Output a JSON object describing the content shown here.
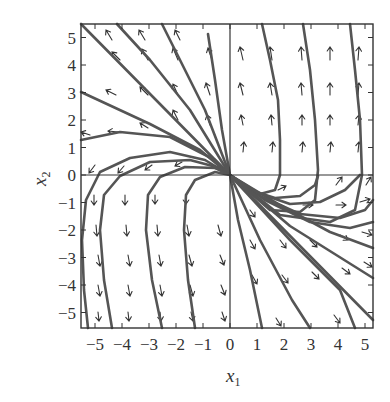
{
  "figure": {
    "type": "phase-portrait",
    "x_label": "x",
    "x_label_sub": "1",
    "y_label": "x",
    "y_label_sub": "2",
    "x_ticks": [
      "-5",
      "-4",
      "-3",
      "-2",
      "-1",
      "0",
      "1",
      "2",
      "3",
      "4",
      "5"
    ],
    "y_ticks": [
      "5",
      "4",
      "3",
      "2",
      "1",
      "0",
      "-1",
      "-2",
      "-3",
      "-4",
      "-5"
    ],
    "x_range": [
      -5.5,
      5.4
    ],
    "y_range": [
      -5.5,
      5.5
    ],
    "colors": {
      "trajectory": "#555555",
      "vector": "#333333",
      "frame": "#333333"
    }
  },
  "mapping": {
    "origin_px": [
      230,
      175
    ],
    "px_per_unit_x": 27,
    "px_per_unit_y": 27.5
  },
  "trajectories": [
    [
      [
        81,
        24
      ],
      [
        230,
        175
      ],
      [
        373,
        320
      ]
    ],
    [
      [
        81,
        92
      ],
      [
        150,
        124
      ],
      [
        200,
        150
      ],
      [
        230,
        175
      ],
      [
        290,
        226
      ],
      [
        373,
        278
      ]
    ],
    [
      [
        81,
        140
      ],
      [
        120,
        132
      ],
      [
        170,
        137
      ],
      [
        215,
        160
      ],
      [
        230,
        175
      ],
      [
        280,
        205
      ],
      [
        330,
        232
      ],
      [
        373,
        248
      ]
    ],
    [
      [
        88,
        328
      ],
      [
        84,
        290
      ],
      [
        82,
        240
      ],
      [
        86,
        200
      ],
      [
        100,
        172
      ],
      [
        130,
        158
      ],
      [
        170,
        152
      ],
      [
        205,
        160
      ],
      [
        230,
        175
      ],
      [
        265,
        200
      ],
      [
        310,
        222
      ],
      [
        350,
        228
      ],
      [
        373,
        222
      ]
    ],
    [
      [
        112,
        328
      ],
      [
        104,
        280
      ],
      [
        100,
        230
      ],
      [
        104,
        195
      ],
      [
        120,
        176
      ],
      [
        150,
        162
      ],
      [
        190,
        160
      ],
      [
        220,
        168
      ],
      [
        230,
        175
      ],
      [
        260,
        196
      ],
      [
        300,
        214
      ],
      [
        340,
        218
      ],
      [
        365,
        210
      ],
      [
        373,
        200
      ]
    ],
    [
      [
        162,
        328
      ],
      [
        152,
        280
      ],
      [
        146,
        230
      ],
      [
        148,
        195
      ],
      [
        160,
        177
      ],
      [
        185,
        167
      ],
      [
        215,
        168
      ],
      [
        230,
        175
      ],
      [
        255,
        192
      ],
      [
        290,
        204
      ],
      [
        320,
        202
      ],
      [
        345,
        190
      ],
      [
        360,
        175
      ]
    ],
    [
      [
        195,
        328
      ],
      [
        188,
        280
      ],
      [
        184,
        230
      ],
      [
        186,
        195
      ],
      [
        195,
        180
      ],
      [
        215,
        172
      ],
      [
        230,
        175
      ],
      [
        250,
        190
      ],
      [
        275,
        198
      ],
      [
        300,
        196
      ],
      [
        315,
        185
      ],
      [
        318,
        176
      ]
    ],
    [
      [
        208,
        34
      ],
      [
        215,
        80
      ],
      [
        222,
        130
      ],
      [
        230,
        175
      ],
      [
        260,
        194
      ],
      [
        275,
        190
      ],
      [
        280,
        175
      ],
      [
        280,
        140
      ],
      [
        278,
        100
      ],
      [
        270,
        60
      ],
      [
        262,
        24
      ]
    ],
    [
      [
        162,
        24
      ],
      [
        180,
        60
      ],
      [
        205,
        110
      ],
      [
        230,
        175
      ],
      [
        270,
        210
      ],
      [
        300,
        212
      ],
      [
        315,
        200
      ],
      [
        318,
        170
      ],
      [
        315,
        120
      ],
      [
        310,
        70
      ],
      [
        303,
        24
      ]
    ],
    [
      [
        117,
        24
      ],
      [
        150,
        60
      ],
      [
        190,
        110
      ],
      [
        230,
        175
      ],
      [
        280,
        215
      ],
      [
        330,
        222
      ],
      [
        355,
        210
      ],
      [
        362,
        175
      ],
      [
        360,
        120
      ],
      [
        355,
        70
      ],
      [
        350,
        24
      ]
    ],
    [
      [
        230,
        175
      ],
      [
        238,
        220
      ],
      [
        250,
        270
      ],
      [
        262,
        328
      ]
    ],
    [
      [
        230,
        175
      ],
      [
        260,
        240
      ],
      [
        292,
        300
      ],
      [
        310,
        328
      ]
    ],
    [
      [
        230,
        175
      ],
      [
        290,
        240
      ],
      [
        340,
        290
      ],
      [
        355,
        328
      ]
    ]
  ],
  "vectors": [
    {
      "x": 112,
      "y": 40,
      "dx": -6,
      "dy": -10
    },
    {
      "x": 145,
      "y": 40,
      "dx": -6,
      "dy": -10
    },
    {
      "x": 180,
      "y": 40,
      "dx": -5,
      "dy": -10
    },
    {
      "x": 120,
      "y": 60,
      "dx": -8,
      "dy": -8
    },
    {
      "x": 148,
      "y": 60,
      "dx": -6,
      "dy": -11
    },
    {
      "x": 178,
      "y": 60,
      "dx": -5,
      "dy": -12
    },
    {
      "x": 212,
      "y": 60,
      "dx": -4,
      "dy": -12
    },
    {
      "x": 243,
      "y": 60,
      "dx": -3,
      "dy": -13
    },
    {
      "x": 272,
      "y": 60,
      "dx": -2,
      "dy": -13
    },
    {
      "x": 302,
      "y": 60,
      "dx": -1,
      "dy": -13
    },
    {
      "x": 330,
      "y": 60,
      "dx": 0,
      "dy": -13
    },
    {
      "x": 358,
      "y": 60,
      "dx": 1,
      "dy": -13
    },
    {
      "x": 116,
      "y": 95,
      "dx": -10,
      "dy": -5
    },
    {
      "x": 148,
      "y": 95,
      "dx": -8,
      "dy": -8
    },
    {
      "x": 178,
      "y": 95,
      "dx": -5,
      "dy": -11
    },
    {
      "x": 210,
      "y": 95,
      "dx": -4,
      "dy": -12
    },
    {
      "x": 243,
      "y": 95,
      "dx": -3,
      "dy": -12
    },
    {
      "x": 272,
      "y": 95,
      "dx": -2,
      "dy": -12
    },
    {
      "x": 302,
      "y": 95,
      "dx": -1,
      "dy": -12
    },
    {
      "x": 330,
      "y": 95,
      "dx": 0,
      "dy": -12
    },
    {
      "x": 358,
      "y": 95,
      "dx": 1,
      "dy": -12
    },
    {
      "x": 90,
      "y": 135,
      "dx": -9,
      "dy": -3
    },
    {
      "x": 118,
      "y": 132,
      "dx": -10,
      "dy": -1
    },
    {
      "x": 148,
      "y": 128,
      "dx": -8,
      "dy": -5
    },
    {
      "x": 178,
      "y": 120,
      "dx": -5,
      "dy": -10
    },
    {
      "x": 210,
      "y": 125,
      "dx": -3,
      "dy": -10
    },
    {
      "x": 243,
      "y": 125,
      "dx": -2,
      "dy": -10
    },
    {
      "x": 272,
      "y": 125,
      "dx": -1,
      "dy": -10
    },
    {
      "x": 302,
      "y": 125,
      "dx": 0,
      "dy": -10
    },
    {
      "x": 330,
      "y": 125,
      "dx": 0,
      "dy": -10
    },
    {
      "x": 358,
      "y": 125,
      "dx": 1,
      "dy": -10
    },
    {
      "x": 95,
      "y": 165,
      "dx": -6,
      "dy": 8
    },
    {
      "x": 124,
      "y": 166,
      "dx": -6,
      "dy": 7
    },
    {
      "x": 152,
      "y": 165,
      "dx": -7,
      "dy": 5
    },
    {
      "x": 182,
      "y": 162,
      "dx": -7,
      "dy": 4
    },
    {
      "x": 243,
      "y": 152,
      "dx": 1,
      "dy": -10
    },
    {
      "x": 272,
      "y": 152,
      "dx": 1,
      "dy": -10
    },
    {
      "x": 302,
      "y": 152,
      "dx": 1,
      "dy": -10
    },
    {
      "x": 330,
      "y": 152,
      "dx": 1,
      "dy": -10
    },
    {
      "x": 358,
      "y": 152,
      "dx": 1,
      "dy": -10
    },
    {
      "x": 94,
      "y": 195,
      "dx": 0,
      "dy": 10
    },
    {
      "x": 125,
      "y": 195,
      "dx": 0,
      "dy": 10
    },
    {
      "x": 155,
      "y": 195,
      "dx": 0,
      "dy": 9
    },
    {
      "x": 186,
      "y": 195,
      "dx": 0,
      "dy": 9
    },
    {
      "x": 278,
      "y": 190,
      "dx": 8,
      "dy": -4
    },
    {
      "x": 336,
      "y": 185,
      "dx": 6,
      "dy": -8
    },
    {
      "x": 366,
      "y": 185,
      "dx": 5,
      "dy": -8
    },
    {
      "x": 96,
      "y": 225,
      "dx": 1,
      "dy": 11
    },
    {
      "x": 126,
      "y": 225,
      "dx": 1,
      "dy": 11
    },
    {
      "x": 157,
      "y": 225,
      "dx": 1,
      "dy": 11
    },
    {
      "x": 187,
      "y": 225,
      "dx": 2,
      "dy": 11
    },
    {
      "x": 218,
      "y": 225,
      "dx": 3,
      "dy": 11
    },
    {
      "x": 250,
      "y": 210,
      "dx": 5,
      "dy": 7
    },
    {
      "x": 303,
      "y": 205,
      "dx": 10,
      "dy": 0
    },
    {
      "x": 336,
      "y": 205,
      "dx": 10,
      "dy": 0
    },
    {
      "x": 360,
      "y": 202,
      "dx": 10,
      "dy": -3
    },
    {
      "x": 98,
      "y": 255,
      "dx": 2,
      "dy": 11
    },
    {
      "x": 128,
      "y": 255,
      "dx": 2,
      "dy": 11
    },
    {
      "x": 159,
      "y": 255,
      "dx": 2,
      "dy": 11
    },
    {
      "x": 189,
      "y": 255,
      "dx": 3,
      "dy": 11
    },
    {
      "x": 220,
      "y": 255,
      "dx": 4,
      "dy": 10
    },
    {
      "x": 250,
      "y": 240,
      "dx": 5,
      "dy": 9
    },
    {
      "x": 280,
      "y": 240,
      "dx": 6,
      "dy": 8
    },
    {
      "x": 310,
      "y": 240,
      "dx": 7,
      "dy": 7
    },
    {
      "x": 340,
      "y": 235,
      "dx": 8,
      "dy": 5
    },
    {
      "x": 362,
      "y": 232,
      "dx": 10,
      "dy": 3
    },
    {
      "x": 98,
      "y": 285,
      "dx": 2,
      "dy": 11
    },
    {
      "x": 128,
      "y": 285,
      "dx": 2,
      "dy": 11
    },
    {
      "x": 160,
      "y": 285,
      "dx": 2,
      "dy": 11
    },
    {
      "x": 190,
      "y": 285,
      "dx": 3,
      "dy": 11
    },
    {
      "x": 221,
      "y": 285,
      "dx": 4,
      "dy": 10
    },
    {
      "x": 252,
      "y": 275,
      "dx": 5,
      "dy": 9
    },
    {
      "x": 282,
      "y": 275,
      "dx": 6,
      "dy": 8
    },
    {
      "x": 312,
      "y": 272,
      "dx": 7,
      "dy": 7
    },
    {
      "x": 342,
      "y": 268,
      "dx": 8,
      "dy": 6
    },
    {
      "x": 364,
      "y": 262,
      "dx": 8,
      "dy": 5
    },
    {
      "x": 98,
      "y": 312,
      "dx": 1,
      "dy": 9
    },
    {
      "x": 128,
      "y": 312,
      "dx": 1,
      "dy": 9
    },
    {
      "x": 160,
      "y": 312,
      "dx": 1,
      "dy": 9
    },
    {
      "x": 191,
      "y": 312,
      "dx": 2,
      "dy": 9
    },
    {
      "x": 222,
      "y": 312,
      "dx": 3,
      "dy": 9
    },
    {
      "x": 276,
      "y": 318,
      "dx": 5,
      "dy": 8
    },
    {
      "x": 334,
      "y": 315,
      "dx": 6,
      "dy": 8
    }
  ]
}
